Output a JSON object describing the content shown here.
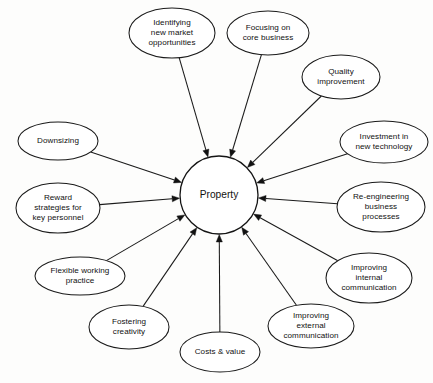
{
  "diagram": {
    "type": "radial-hub-and-spoke",
    "background_color": "#fdfdfc",
    "line_color": "#1a1a1a",
    "text_color": "#111111",
    "arrow_direction": "inward",
    "hub": {
      "label": "Property",
      "cx": 219,
      "cy": 195,
      "r": 39
    },
    "nodes": [
      {
        "id": "identifying-new-market-opportunities",
        "lines": [
          "Identifying",
          "new market",
          "opportunities"
        ],
        "cx": 172,
        "cy": 33,
        "rx": 43,
        "ry": 25
      },
      {
        "id": "focusing-on-core-business",
        "lines": [
          "Focusing on",
          "core business"
        ],
        "cx": 268,
        "cy": 33,
        "rx": 41,
        "ry": 22
      },
      {
        "id": "quality-improvement",
        "lines": [
          "Quality",
          "improvement"
        ],
        "cx": 341,
        "cy": 77,
        "rx": 39,
        "ry": 22
      },
      {
        "id": "investment-in-new-technology",
        "lines": [
          "Investment in",
          "new technology"
        ],
        "cx": 384,
        "cy": 142,
        "rx": 44,
        "ry": 21
      },
      {
        "id": "re-engineering-business-processes",
        "lines": [
          "Re-engineering",
          "business",
          "processes"
        ],
        "cx": 381,
        "cy": 207,
        "rx": 44,
        "ry": 25
      },
      {
        "id": "improving-internal-communication",
        "lines": [
          "Improving",
          "internal",
          "communication"
        ],
        "cx": 369,
        "cy": 278,
        "rx": 43,
        "ry": 25
      },
      {
        "id": "improving-external-communication",
        "lines": [
          "Improving",
          "external",
          "communication"
        ],
        "cx": 311,
        "cy": 326,
        "rx": 43,
        "ry": 22
      },
      {
        "id": "costs-and-value",
        "lines": [
          "Costs & value"
        ],
        "cx": 220,
        "cy": 352,
        "rx": 40,
        "ry": 20
      },
      {
        "id": "fostering-creativity",
        "lines": [
          "Fostering",
          "creativity"
        ],
        "cx": 129,
        "cy": 327,
        "rx": 40,
        "ry": 22
      },
      {
        "id": "flexible-working-practice",
        "lines": [
          "Flexible working",
          "practice"
        ],
        "cx": 80,
        "cy": 276,
        "rx": 45,
        "ry": 19
      },
      {
        "id": "reward-strategies-for-key-personnel",
        "lines": [
          "Reward",
          "strategies for",
          "key personnel"
        ],
        "cx": 58,
        "cy": 208,
        "rx": 42,
        "ry": 25
      },
      {
        "id": "downsizing",
        "lines": [
          "Downsizing"
        ],
        "cx": 58,
        "cy": 141,
        "rx": 40,
        "ry": 19
      }
    ]
  }
}
